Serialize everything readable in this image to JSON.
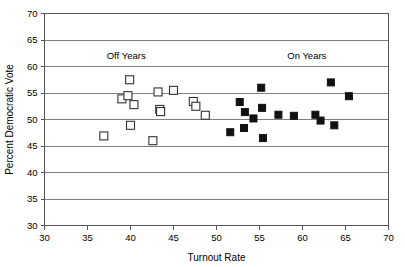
{
  "chart_data": {
    "type": "scatter",
    "title": "",
    "xlabel": "Turnout Rate",
    "ylabel": "Percent Democratic Vote",
    "xlim": [
      30,
      70
    ],
    "ylim": [
      30,
      70
    ],
    "xticks": [
      30,
      35,
      40,
      45,
      50,
      55,
      60,
      65,
      70
    ],
    "yticks": [
      30,
      35,
      40,
      45,
      50,
      55,
      60,
      65,
      70
    ],
    "xtick_labels": [
      "30",
      "35",
      "40",
      "45",
      "50",
      "55",
      "60",
      "65",
      "70"
    ],
    "ytick_labels": [
      "30",
      "35",
      "40",
      "45",
      "50",
      "55",
      "60",
      "65",
      "70"
    ],
    "grid": "horizontal",
    "legend_position": "in-plot-annotations",
    "annotations": [
      {
        "text": "Off Years",
        "x": 39.5,
        "y": 61.5
      },
      {
        "text": "On Years",
        "x": 60.5,
        "y": 61.5
      }
    ],
    "series": [
      {
        "name": "Off Years",
        "marker": "open-square",
        "marker_fill": "#ffffff",
        "marker_edge": "#333333",
        "points": [
          {
            "x": 36.9,
            "y": 46.9
          },
          {
            "x": 39.0,
            "y": 53.9
          },
          {
            "x": 39.7,
            "y": 54.5
          },
          {
            "x": 39.9,
            "y": 57.5
          },
          {
            "x": 40.0,
            "y": 48.9
          },
          {
            "x": 40.4,
            "y": 52.8
          },
          {
            "x": 42.6,
            "y": 46.0
          },
          {
            "x": 43.2,
            "y": 55.2
          },
          {
            "x": 43.4,
            "y": 51.9
          },
          {
            "x": 43.5,
            "y": 51.5
          },
          {
            "x": 45.0,
            "y": 55.5
          },
          {
            "x": 47.3,
            "y": 53.4
          },
          {
            "x": 47.6,
            "y": 52.5
          },
          {
            "x": 48.7,
            "y": 50.8
          }
        ]
      },
      {
        "name": "On Years",
        "marker": "filled-square",
        "marker_fill": "#111111",
        "marker_edge": "#111111",
        "points": [
          {
            "x": 51.6,
            "y": 47.6
          },
          {
            "x": 52.7,
            "y": 53.3
          },
          {
            "x": 53.2,
            "y": 48.4
          },
          {
            "x": 53.3,
            "y": 51.4
          },
          {
            "x": 54.3,
            "y": 50.2
          },
          {
            "x": 55.2,
            "y": 56.0
          },
          {
            "x": 55.3,
            "y": 52.2
          },
          {
            "x": 55.4,
            "y": 46.5
          },
          {
            "x": 57.2,
            "y": 50.9
          },
          {
            "x": 59.0,
            "y": 50.7
          },
          {
            "x": 61.5,
            "y": 50.9
          },
          {
            "x": 62.1,
            "y": 49.8
          },
          {
            "x": 63.3,
            "y": 57.0
          },
          {
            "x": 63.7,
            "y": 48.9
          },
          {
            "x": 65.4,
            "y": 54.4
          }
        ]
      }
    ]
  },
  "colors": {
    "background": "#ffffff",
    "gridline": "#808080",
    "axis": "#555555",
    "text": "#000000",
    "open_marker_fill": "#ffffff",
    "open_marker_edge": "#333333",
    "filled_marker": "#111111"
  }
}
